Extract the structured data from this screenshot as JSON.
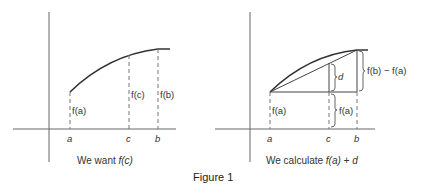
{
  "figure": {
    "caption": "Figure 1"
  },
  "left_panel": {
    "caption_prefix": "We want ",
    "caption_expr": "f(c)",
    "x_ticks": [
      "a",
      "c",
      "b"
    ],
    "labels": {
      "fa": "f(a)",
      "fc": "f(c)",
      "fb": "f(b)"
    }
  },
  "right_panel": {
    "caption_prefix": "We calculate ",
    "caption_expr": "f(a) + d",
    "x_ticks": [
      "a",
      "c",
      "b"
    ],
    "labels": {
      "fa_left": "f(a)",
      "fa_right": "f(a)",
      "d": "d",
      "diff": "f(b) − f(a)"
    }
  },
  "colors": {
    "axis": "#555555",
    "curve": "#333333",
    "dashed": "#666666",
    "text": "#333333"
  }
}
